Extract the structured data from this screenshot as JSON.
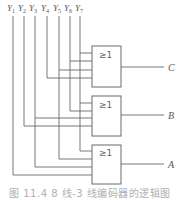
{
  "diagram": {
    "inputs": [
      {
        "name": "Y",
        "sub": "1",
        "x": 13
      },
      {
        "name": "Y",
        "sub": "2",
        "x": 24
      },
      {
        "name": "Y",
        "sub": "3",
        "x": 35
      },
      {
        "name": "Y",
        "sub": "4",
        "x": 47
      },
      {
        "name": "Y",
        "sub": "5",
        "x": 59
      },
      {
        "name": "Y",
        "sub": "6",
        "x": 70
      },
      {
        "name": "Y",
        "sub": "7",
        "x": 80
      }
    ],
    "gates": [
      {
        "label": "≥1",
        "output": "C",
        "inputs": [
          "Y7",
          "Y6",
          "Y5",
          "Y4"
        ]
      },
      {
        "label": "≥1",
        "output": "B",
        "inputs": [
          "Y7",
          "Y6",
          "Y3",
          "Y2"
        ]
      },
      {
        "label": "≥1",
        "output": "A",
        "inputs": [
          "Y7",
          "Y5",
          "Y3",
          "Y1"
        ]
      }
    ],
    "caption": "图 11.4  8 线-3 线编码器的逻辑图"
  }
}
